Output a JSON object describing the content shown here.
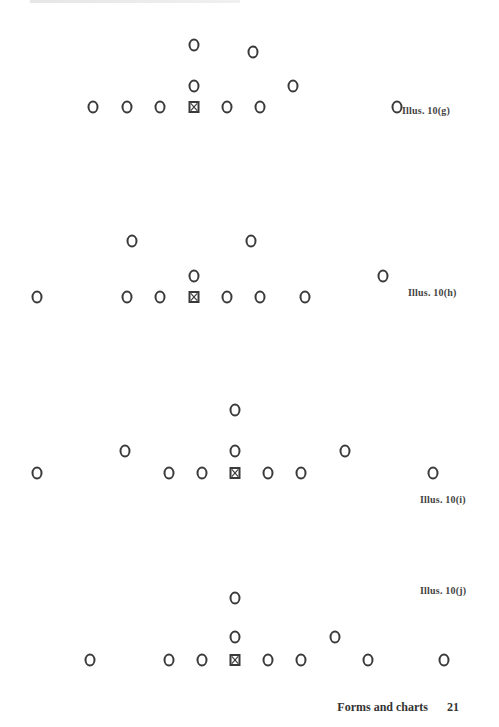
{
  "page": {
    "footer": {
      "section": "Forms and charts",
      "page_number": "21"
    }
  },
  "diagrams": [
    {
      "caption": "Illus. 10(g)",
      "caption_pos": [
        402,
        111
      ],
      "center": [
        194,
        107
      ],
      "players": [
        [
          194,
          45
        ],
        [
          253,
          52
        ],
        [
          194,
          86
        ],
        [
          293,
          86
        ],
        [
          93,
          107
        ],
        [
          127,
          107
        ],
        [
          160,
          107
        ],
        [
          227,
          107
        ],
        [
          260,
          107
        ],
        [
          397,
          107
        ]
      ]
    },
    {
      "caption": "Illus. 10(h)",
      "caption_pos": [
        408,
        293
      ],
      "center": [
        194,
        297
      ],
      "players": [
        [
          132,
          241
        ],
        [
          251,
          241
        ],
        [
          194,
          276
        ],
        [
          383,
          276
        ],
        [
          37,
          297
        ],
        [
          127,
          297
        ],
        [
          160,
          297
        ],
        [
          227,
          297
        ],
        [
          260,
          297
        ],
        [
          305,
          297
        ]
      ]
    },
    {
      "caption": "Illus. 10(i)",
      "caption_pos": [
        420,
        500
      ],
      "center": [
        235,
        473
      ],
      "players": [
        [
          235,
          410
        ],
        [
          125,
          451
        ],
        [
          235,
          451
        ],
        [
          345,
          451
        ],
        [
          37,
          473
        ],
        [
          169,
          473
        ],
        [
          202,
          473
        ],
        [
          268,
          473
        ],
        [
          301,
          473
        ],
        [
          433,
          473
        ]
      ]
    },
    {
      "caption": "Illus. 10(j)",
      "caption_pos": [
        420,
        591
      ],
      "center": [
        235,
        660
      ],
      "players": [
        [
          235,
          598
        ],
        [
          235,
          637
        ],
        [
          335,
          637
        ],
        [
          90,
          660
        ],
        [
          169,
          660
        ],
        [
          202,
          660
        ],
        [
          268,
          660
        ],
        [
          301,
          660
        ],
        [
          368,
          660
        ],
        [
          444,
          660
        ]
      ]
    }
  ],
  "legend": {
    "player_symbol": "circle-icon",
    "center_symbol": "boxed-x-icon"
  }
}
